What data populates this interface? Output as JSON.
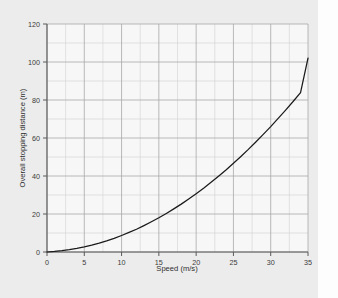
{
  "figure": {
    "background_color": "#ececec",
    "plot_background_color": "#f7f7f7",
    "page_margin_color": "#fdfdfd"
  },
  "chart_data": {
    "type": "line",
    "title": "",
    "xlabel": "Speed (m/s)",
    "ylabel": "Overall stopping distance (m)",
    "xlim": [
      0,
      35
    ],
    "ylim": [
      0,
      120
    ],
    "xticks": [
      0,
      5,
      10,
      15,
      20,
      25,
      30,
      35
    ],
    "yticks": [
      0,
      20,
      40,
      60,
      80,
      100,
      120
    ],
    "xtick_labels": [
      "0",
      "5",
      "10",
      "15",
      "20",
      "25",
      "30",
      "35"
    ],
    "ytick_labels": [
      "0",
      "20",
      "40",
      "60",
      "80",
      "100",
      "120"
    ],
    "grid": true,
    "minor_grid": true,
    "x_minor_step": 2.5,
    "y_minor_step": 10,
    "legend": null,
    "line_color": "#1a1a1a",
    "grid_color": "#b9b9b9",
    "axis_color": "#5a5a5a",
    "series": [
      {
        "name": "Overall stopping distance",
        "x": [
          0,
          1,
          2,
          3,
          4,
          5,
          6,
          7,
          8,
          9,
          10,
          11,
          12,
          13,
          14,
          15,
          16,
          17,
          18,
          19,
          20,
          21,
          22,
          23,
          24,
          25,
          26,
          27,
          28,
          29,
          30,
          31,
          32,
          33,
          34,
          35
        ],
        "values": [
          0.0,
          0.3,
          0.7,
          1.2,
          1.9,
          2.7,
          3.6,
          4.7,
          5.9,
          7.2,
          8.7,
          10.3,
          12.0,
          13.9,
          15.9,
          18.0,
          20.3,
          22.7,
          25.2,
          27.9,
          30.7,
          33.6,
          36.7,
          39.9,
          43.2,
          46.7,
          50.3,
          54.0,
          57.9,
          61.9,
          66.0,
          70.3,
          74.7,
          79.2,
          83.9,
          102.0
        ]
      }
    ],
    "notable_points": [
      {
        "x": 0,
        "y": 0
      },
      {
        "x": 10,
        "y": 14
      },
      {
        "x": 20,
        "y": 40
      },
      {
        "x": 30,
        "y": 73
      },
      {
        "x": 35,
        "y": 102
      }
    ]
  }
}
